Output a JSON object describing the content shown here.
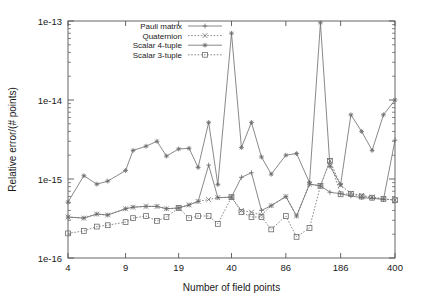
{
  "figure": {
    "name": "relative-error-vs-field-points-plot",
    "background": "#ffffff",
    "frame_color": "#555555",
    "series_color": "#6b6b6b"
  },
  "chart_data": {
    "type": "line",
    "title": "",
    "xlabel": "Number of field points",
    "ylabel": "Relative error/(# points)",
    "xscale": "log",
    "yscale": "log",
    "xlim": [
      4,
      400
    ],
    "ylim": [
      1e-16,
      1e-13
    ],
    "grid": false,
    "legend_position": "top-left-inside",
    "xticks": [
      4,
      9,
      19,
      40,
      86,
      186,
      400
    ],
    "xtick_labels": [
      "4",
      "9",
      "19",
      "40",
      "86",
      "186",
      "400"
    ],
    "yticks": [
      1e-16,
      1e-15,
      1e-14,
      1e-13
    ],
    "ytick_labels": [
      "1e-16",
      "1e-15",
      "1e-14",
      "1e-13"
    ],
    "x": [
      4,
      5,
      6,
      7,
      9,
      10,
      12,
      14,
      16,
      19,
      22,
      25,
      29,
      33,
      40,
      46,
      53,
      61,
      70,
      86,
      100,
      120,
      140,
      160,
      186,
      215,
      250,
      290,
      340,
      400
    ],
    "series": [
      {
        "name": "Pauli matrix",
        "marker": "plus",
        "linestyle": "solid",
        "values": [
          3.3e-16,
          3.2e-16,
          3.6e-16,
          3.5e-16,
          4.2e-16,
          4.4e-16,
          4.5e-16,
          4.5e-16,
          4.2e-16,
          4.3e-16,
          4.7e-16,
          5.2e-16,
          1.5e-15,
          5.8e-16,
          5.9e-16,
          1.05e-15,
          1.2e-15,
          4e-16,
          4.6e-16,
          6e-16,
          3.4e-16,
          8.6e-16,
          8.2e-16,
          6.8e-16,
          6.5e-16,
          6.1e-16,
          5.8e-16,
          5.7e-16,
          5.5e-16,
          3.1e-15
        ]
      },
      {
        "name": "Quaternion",
        "marker": "cross",
        "linestyle": "dotted",
        "values": [
          3.3e-16,
          3.2e-16,
          3.6e-16,
          3.5e-16,
          4.2e-16,
          4.4e-16,
          4.5e-16,
          4.5e-16,
          4.2e-16,
          4.3e-16,
          4.7e-16,
          5.2e-16,
          5.5e-16,
          5.8e-16,
          5.9e-16,
          4e-16,
          3.8e-16,
          3.5e-16,
          4.6e-16,
          6e-16,
          3.4e-16,
          8.6e-16,
          8.2e-16,
          1.7e-15,
          8.3e-16,
          6.6e-16,
          6.2e-16,
          5.9e-16,
          5.6e-16,
          5.4e-16
        ]
      },
      {
        "name": "Scalar 4-tuple",
        "marker": "star",
        "linestyle": "solid",
        "values": [
          5.1e-16,
          1.1e-15,
          8.6e-16,
          9.4e-16,
          1.28e-15,
          2.3e-15,
          2.6e-15,
          3e-15,
          1.95e-15,
          2.4e-15,
          2.45e-15,
          1.4e-15,
          5.2e-15,
          8.5e-16,
          7e-14,
          2.5e-15,
          5.2e-15,
          1.9e-15,
          1.15e-15,
          2e-15,
          2.1e-15,
          9e-16,
          9.5e-14,
          1.45e-15,
          8.5e-16,
          6.5e-15,
          4e-15,
          2.3e-15,
          6.5e-15,
          1e-14
        ]
      },
      {
        "name": "Scalar 3-tuple",
        "marker": "square",
        "linestyle": "dotted",
        "values": [
          2.05e-16,
          2.2e-16,
          2.5e-16,
          2.6e-16,
          2.85e-16,
          3.2e-16,
          3.4e-16,
          2.95e-16,
          3.3e-16,
          4.3e-16,
          3.2e-16,
          3.4e-16,
          3.4e-16,
          2.7e-16,
          5.9e-16,
          3.8e-16,
          3.3e-16,
          3.3e-16,
          2.3e-16,
          3.4e-16,
          1.85e-16,
          2.4e-16,
          8.2e-16,
          1.7e-15,
          6.4e-16,
          6.5e-16,
          6e-16,
          5.8e-16,
          5.6e-16,
          5.4e-16
        ]
      }
    ]
  }
}
